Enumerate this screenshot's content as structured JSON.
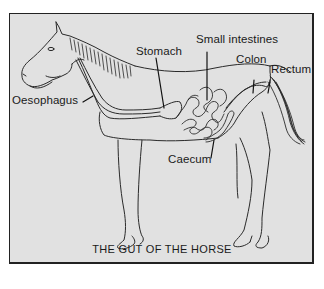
{
  "figure": {
    "title": "THE GUT OF THE HORSE",
    "subject": "horse",
    "colors": {
      "background": "#e1e1e1",
      "outline": "#2a2a2a",
      "frame": "#222222"
    }
  },
  "labels": [
    {
      "id": "oesophagus",
      "text": "Oesophagus"
    },
    {
      "id": "stomach",
      "text": "Stomach"
    },
    {
      "id": "small-intestines",
      "text": "Small intestines"
    },
    {
      "id": "colon",
      "text": "Colon"
    },
    {
      "id": "rectum",
      "text": "Rectum"
    },
    {
      "id": "caecum",
      "text": "Caecum"
    }
  ]
}
